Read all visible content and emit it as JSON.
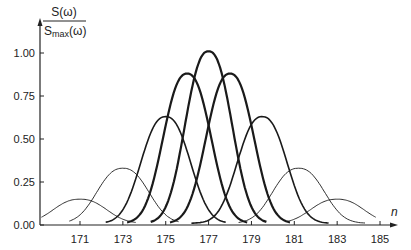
{
  "chart_data": {
    "type": "line",
    "title": "",
    "ylabel_numerator": "S(ω)",
    "ylabel_denominator_main": "S",
    "ylabel_denominator_sub": "max",
    "ylabel_denominator_tail": "(ω)",
    "xlabel": "n",
    "xlim": [
      169.2,
      186.5
    ],
    "ylim": [
      0,
      1.05
    ],
    "grid": false,
    "legend": "none",
    "x_ticks": [
      171,
      173,
      175,
      177,
      179,
      181,
      183,
      185
    ],
    "x_tick_labels": [
      "171",
      "173",
      "175",
      "177",
      "179",
      "181",
      "183",
      "185"
    ],
    "y_ticks": [
      0,
      0.25,
      0.5,
      0.75,
      1.0
    ],
    "y_tick_labels": [
      "0.00",
      "0.25",
      "0.50",
      "0.75",
      "1.00"
    ],
    "series": [
      {
        "name": "peak-171",
        "center": 171,
        "peak": 0.14,
        "range": [
          169.2,
          173.6
        ],
        "weight": "thin"
      },
      {
        "name": "peak-173",
        "center": 173,
        "peak": 0.32,
        "range": [
          170.5,
          175.6
        ],
        "weight": "thin"
      },
      {
        "name": "peak-175",
        "center": 175,
        "peak": 0.62,
        "range": [
          172.2,
          177.8
        ],
        "weight": "medium"
      },
      {
        "name": "peak-176",
        "center": 176,
        "peak": 0.87,
        "range": [
          173.2,
          178.8
        ],
        "weight": "thick"
      },
      {
        "name": "peak-177",
        "center": 177,
        "peak": 1.0,
        "range": [
          174.3,
          179.7
        ],
        "weight": "thick"
      },
      {
        "name": "peak-178",
        "center": 178,
        "peak": 0.87,
        "range": [
          175.2,
          180.8
        ],
        "weight": "thick"
      },
      {
        "name": "peak-179",
        "center": 179.5,
        "peak": 0.62,
        "range": [
          176.2,
          182.6
        ],
        "weight": "medium"
      },
      {
        "name": "peak-181",
        "center": 181.2,
        "peak": 0.32,
        "range": [
          178.4,
          184.3
        ],
        "weight": "thin"
      },
      {
        "name": "peak-183",
        "center": 183,
        "peak": 0.14,
        "range": [
          180.6,
          184.8
        ],
        "weight": "thin"
      }
    ]
  }
}
